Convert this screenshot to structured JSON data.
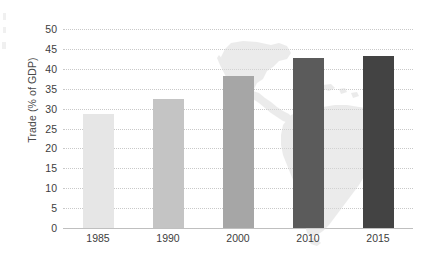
{
  "chart_data": {
    "type": "bar",
    "title": "",
    "subtitle": "",
    "xlabel": "",
    "ylabel": "Trade (% of GDP)",
    "categories": [
      "1985",
      "1990",
      "2000",
      "2010",
      "2015"
    ],
    "values": [
      28.7,
      32.3,
      38.3,
      42.8,
      43.2
    ],
    "series": [
      {
        "name": "Trade (% of GDP)",
        "values": [
          28.7,
          32.3,
          38.3,
          42.8,
          43.2
        ]
      }
    ],
    "ylim": [
      0,
      50
    ],
    "xlim": [
      0,
      5
    ],
    "y_ticks": [
      0,
      5,
      10,
      15,
      20,
      25,
      30,
      35,
      40,
      45,
      50
    ],
    "y_tick_labels": [
      "0",
      "5",
      "10",
      "15",
      "20",
      "25",
      "30",
      "35",
      "40",
      "45",
      "50"
    ],
    "x_tick_labels": [
      "1985",
      "1990",
      "2000",
      "2010",
      "2015"
    ],
    "grid": "horizontal-dotted",
    "legend": "none",
    "legend_position": "none",
    "annotations": [],
    "bar_colors": [
      "#e6e6e6",
      "#c4c4c4",
      "#a6a6a6",
      "#5b5b5b",
      "#434343"
    ],
    "background_watermark": "latin-america-map",
    "gridline_color": "#c9c9c9",
    "axis_color": "#bfbfbf",
    "tick_label_color": "#3d3d3d",
    "axis_title_color": "#4a4a4a",
    "plot_background": "#ffffff"
  }
}
